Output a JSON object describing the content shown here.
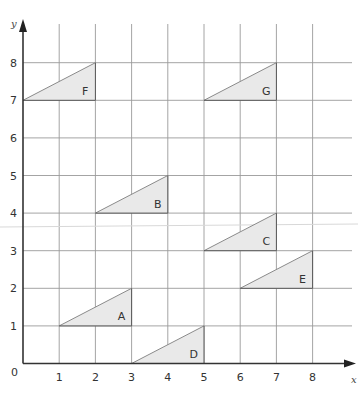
{
  "diagram": {
    "type": "coordinate-grid",
    "axes": {
      "x_label": "x",
      "y_label": "y",
      "origin_label": "0",
      "x_ticks": [
        "1",
        "2",
        "3",
        "4",
        "5",
        "6",
        "7",
        "8"
      ],
      "y_ticks": [
        "1",
        "2",
        "3",
        "4",
        "5",
        "6",
        "7",
        "8"
      ],
      "x_range": [
        0,
        8
      ],
      "y_range": [
        0,
        8
      ]
    },
    "shapes": [
      {
        "label": "A",
        "vertices": [
          [
            1,
            1
          ],
          [
            3,
            1
          ],
          [
            3,
            2
          ]
        ]
      },
      {
        "label": "B",
        "vertices": [
          [
            2,
            4
          ],
          [
            4,
            4
          ],
          [
            4,
            5
          ]
        ]
      },
      {
        "label": "C",
        "vertices": [
          [
            5,
            3
          ],
          [
            7,
            3
          ],
          [
            7,
            4
          ]
        ]
      },
      {
        "label": "D",
        "vertices": [
          [
            3,
            0
          ],
          [
            5,
            0
          ],
          [
            5,
            1
          ]
        ]
      },
      {
        "label": "E",
        "vertices": [
          [
            6,
            2
          ],
          [
            8,
            2
          ],
          [
            8,
            3
          ]
        ]
      },
      {
        "label": "F",
        "vertices": [
          [
            0,
            7
          ],
          [
            2,
            7
          ],
          [
            2,
            8
          ]
        ]
      },
      {
        "label": "G",
        "vertices": [
          [
            5,
            7
          ],
          [
            7,
            7
          ],
          [
            7,
            8
          ]
        ]
      }
    ],
    "colors": {
      "triangle_fill": "#e9e9e9",
      "grid": "#9a9a9a",
      "axis": "#333333"
    }
  }
}
